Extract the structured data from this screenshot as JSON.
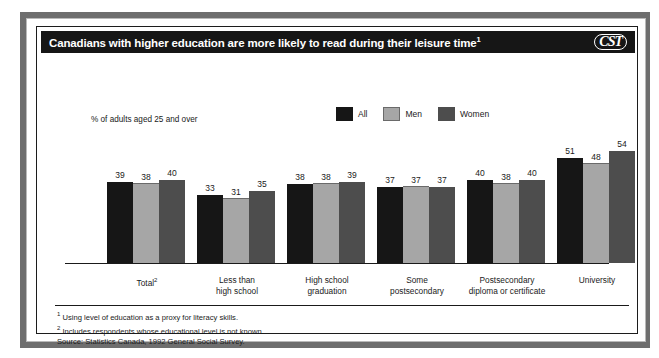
{
  "header": {
    "title": "Canadians with higher education are more likely to read during their leisure time",
    "title_footnote_marker": "1",
    "logo": "CST"
  },
  "axis_note": "% of adults aged 25 and over",
  "legend": {
    "items": [
      {
        "label": "All",
        "color": "#161616"
      },
      {
        "label": "Men",
        "color": "#a6a6a6"
      },
      {
        "label": "Women",
        "color": "#4d4d4d"
      }
    ]
  },
  "footnotes": [
    {
      "marker": "1",
      "text": "Using level of education as a proxy for literacy skills."
    },
    {
      "marker": "2",
      "text": "Includes respondents whose educational level is not known."
    },
    {
      "marker": "",
      "text": "Source: Statistics Canada, 1992 General Social Survey."
    }
  ],
  "chart_data": {
    "type": "bar",
    "title": "Canadians with higher education are more likely to read during their leisure time",
    "xlabel": "",
    "ylabel": "% of adults aged 25 and over",
    "ylim": [
      0,
      60
    ],
    "grid": false,
    "legend_position": "top-right",
    "categories": [
      "Total²",
      "Less than high school",
      "High school graduation",
      "Some postsecondary",
      "Postsecondary diploma or certificate",
      "University"
    ],
    "category_lines": [
      [
        "Total",
        ""
      ],
      [
        "Less than",
        "high school"
      ],
      [
        "High school",
        "graduation"
      ],
      [
        "Some",
        "postsecondary"
      ],
      [
        "Postsecondary",
        "diploma or certificate"
      ],
      [
        "University",
        ""
      ]
    ],
    "series": [
      {
        "name": "All",
        "color": "#161616",
        "values": [
          39,
          33,
          38,
          37,
          40,
          51
        ]
      },
      {
        "name": "Men",
        "color": "#a6a6a6",
        "values": [
          38,
          31,
          38,
          37,
          38,
          48
        ]
      },
      {
        "name": "Women",
        "color": "#4d4d4d",
        "values": [
          40,
          35,
          39,
          37,
          40,
          54
        ]
      }
    ]
  }
}
